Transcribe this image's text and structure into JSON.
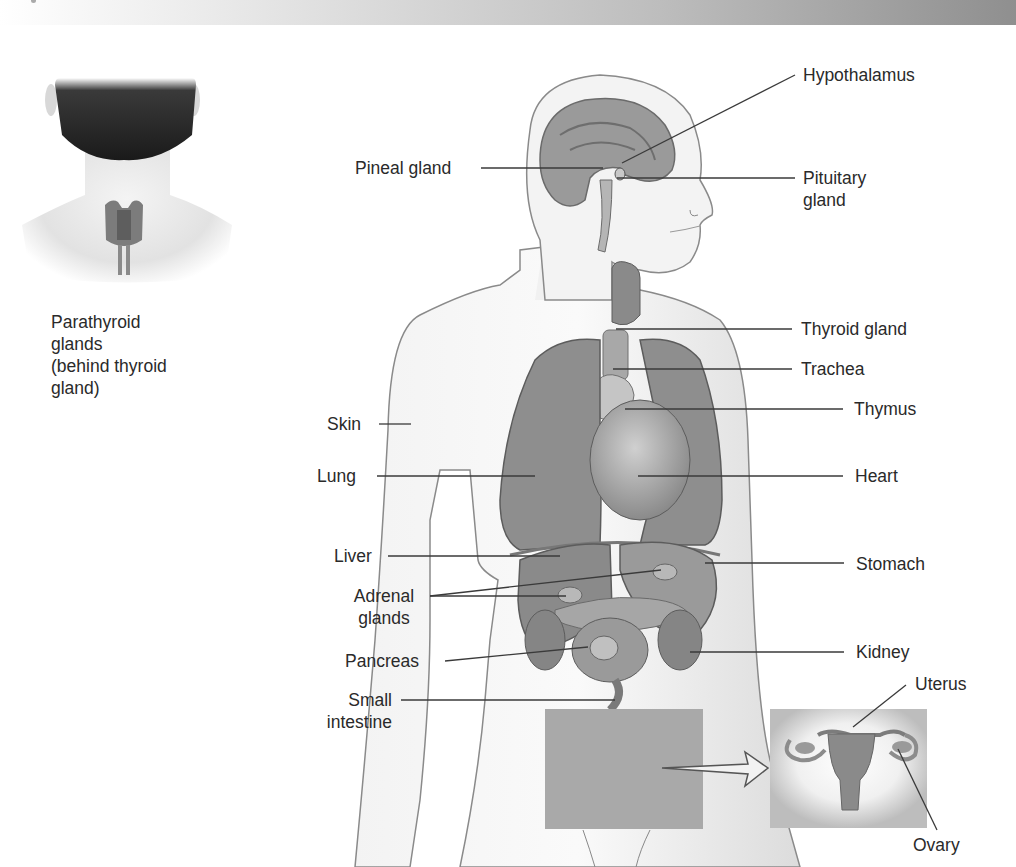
{
  "figure": {
    "type": "anatomical-diagram",
    "colors": {
      "organ_fill": "#8e8e8e",
      "skin_fill": "#ececec",
      "outline": "#6b6b6b",
      "leader_line": "#3a3a3a",
      "label_text": "#2a2a2a",
      "highlight_box": "#a9a9a9",
      "header_gradient_start": "#ffffff",
      "header_gradient_end": "#8f8f8f"
    }
  },
  "inset_neck": {
    "caption": "Parathyroid\nglands\n(behind thyroid\ngland)"
  },
  "inset_uterus": {
    "labels": {
      "uterus": "Uterus",
      "ovary": "Ovary"
    }
  },
  "labels_left": {
    "pineal": "Pineal gland",
    "skin": "Skin",
    "lung": "Lung",
    "liver": "Liver",
    "adrenal": "Adrenal\nglands",
    "pancreas": "Pancreas",
    "small_intestine": "Small\nintestine"
  },
  "labels_right": {
    "hypothalamus": "Hypothalamus",
    "pituitary": "Pituitary\ngland",
    "thyroid": "Thyroid gland",
    "trachea": "Trachea",
    "thymus": "Thymus",
    "heart": "Heart",
    "stomach": "Stomach",
    "kidney": "Kidney"
  }
}
